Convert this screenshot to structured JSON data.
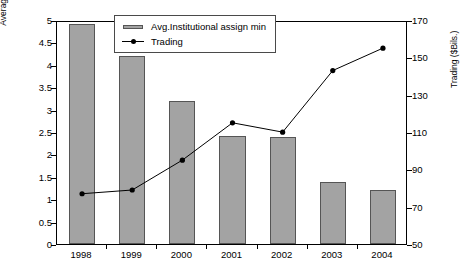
{
  "chart_data": {
    "type": "bar",
    "title": "",
    "subtitle": "",
    "categories": [
      "1998",
      "1999",
      "2000",
      "2001",
      "2002",
      "2003",
      "2004"
    ],
    "xlabel": "",
    "series": [
      {
        "name": "Avg.Institutional assign min",
        "type": "bar",
        "axis": "left",
        "values": [
          4.9,
          4.2,
          3.2,
          2.42,
          2.38,
          1.38,
          1.2
        ]
      },
      {
        "name": "Trading",
        "type": "line",
        "axis": "right",
        "values": [
          78,
          80,
          96,
          116,
          111,
          144,
          156
        ]
      }
    ],
    "left_axis": {
      "label": "Average institutional assignment min ($Millions)",
      "ylim": [
        0,
        5
      ],
      "ticks": [
        "0",
        "0.5",
        "1",
        "1.5",
        "2",
        "2.5",
        "3",
        "3.5",
        "4",
        "4.5",
        "5"
      ],
      "tick_values": [
        0,
        0.5,
        1,
        1.5,
        2,
        2.5,
        3,
        3.5,
        4,
        4.5,
        5
      ]
    },
    "right_axis": {
      "label": "Trading ($Bils.)",
      "ylim": [
        50,
        170
      ],
      "ticks": [
        "50",
        "70",
        "90",
        "110",
        "130",
        "150",
        "170"
      ],
      "tick_values": [
        50,
        70,
        90,
        110,
        130,
        150,
        170
      ]
    },
    "grid": false,
    "legend": {
      "position": "top-center",
      "entries": [
        {
          "label": "Avg.Institutional assign min",
          "marker": "bar-swatch",
          "color": "#a3a3a3"
        },
        {
          "label": "Trading",
          "marker": "line-with-dot",
          "color": "#000000"
        }
      ]
    },
    "colors": {
      "bar_fill": "#a3a3a3",
      "bar_edge": "#555555",
      "line": "#000000",
      "marker": "#000000",
      "axis": "#000000",
      "background": "#ffffff"
    }
  }
}
